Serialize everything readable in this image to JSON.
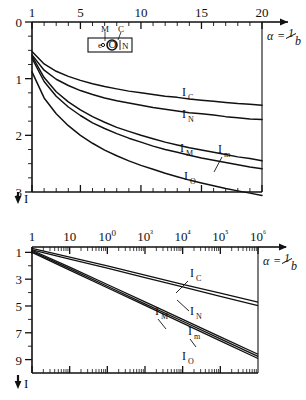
{
  "figure": {
    "panels": [
      {
        "name": "upper-panel",
        "axis_label_x": "α = 1/b",
        "axis_label_y": "I"
      },
      {
        "name": "lower-panel",
        "axis_label_x": "α = 1/b",
        "axis_label_y": "I"
      }
    ],
    "legend": {
      "name": "schematic-inset",
      "labels": {
        "m": "M",
        "c": "C",
        "n": "N",
        "e": "e",
        "o": "O"
      }
    },
    "alpha_symbol": "α",
    "equals": "=",
    "one": "1",
    "b": "b",
    "arrow_label": "I"
  },
  "chart_data": [
    {
      "type": "line",
      "name": "upper-panel",
      "title": "",
      "xlabel": "α = 1/b",
      "ylabel": "I",
      "xscale": "linear",
      "yscale": "linear",
      "xlim": [
        1,
        20
      ],
      "ylim": [
        0,
        3
      ],
      "y_inverted": true,
      "grid": false,
      "xticks": [
        1,
        5,
        10,
        15,
        20
      ],
      "xticklabels": [
        "1",
        "5",
        "10",
        "15",
        "20"
      ],
      "xminor_step": 1,
      "yticks": [
        0,
        1,
        2,
        3
      ],
      "yticklabels": [
        "0",
        "1",
        "2",
        "3"
      ],
      "yminor_step": 0.25,
      "legend_position": "inline-labels",
      "series": [
        {
          "name": "I_C",
          "label": "I",
          "sublabel": "C",
          "x": [
            1,
            2,
            3,
            4,
            5,
            6,
            7,
            8,
            9,
            10,
            11,
            12,
            13,
            14,
            15,
            16,
            17,
            18,
            19,
            20
          ],
          "y": [
            0.52,
            0.74,
            0.87,
            0.96,
            1.03,
            1.09,
            1.14,
            1.18,
            1.22,
            1.25,
            1.28,
            1.31,
            1.33,
            1.36,
            1.38,
            1.4,
            1.42,
            1.44,
            1.45,
            1.47
          ]
        },
        {
          "name": "I_N",
          "label": "I",
          "sublabel": "N",
          "x": [
            1,
            2,
            3,
            4,
            5,
            6,
            7,
            8,
            9,
            10,
            11,
            12,
            13,
            14,
            15,
            16,
            17,
            18,
            19,
            20
          ],
          "y": [
            0.58,
            0.85,
            1.01,
            1.12,
            1.21,
            1.28,
            1.34,
            1.39,
            1.43,
            1.47,
            1.51,
            1.54,
            1.57,
            1.6,
            1.62,
            1.64,
            1.67,
            1.69,
            1.71,
            1.72
          ]
        },
        {
          "name": "I_M",
          "label": "I",
          "sublabel": "M",
          "x": [
            1,
            2,
            3,
            4,
            5,
            6,
            7,
            8,
            9,
            10,
            11,
            12,
            13,
            14,
            15,
            16,
            17,
            18,
            19,
            20
          ],
          "y": [
            0.6,
            0.98,
            1.23,
            1.41,
            1.55,
            1.67,
            1.77,
            1.86,
            1.93,
            2.0,
            2.06,
            2.12,
            2.17,
            2.22,
            2.26,
            2.3,
            2.34,
            2.38,
            2.41,
            2.45
          ]
        },
        {
          "name": "I_m",
          "label": "I",
          "sublabel": "m",
          "x": [
            1,
            2,
            3,
            4,
            5,
            6,
            7,
            8,
            9,
            10,
            11,
            12,
            13,
            14,
            15,
            16,
            17,
            18,
            19,
            20
          ],
          "y": [
            0.64,
            1.05,
            1.31,
            1.5,
            1.65,
            1.78,
            1.88,
            1.97,
            2.05,
            2.12,
            2.19,
            2.25,
            2.3,
            2.35,
            2.4,
            2.44,
            2.48,
            2.52,
            2.56,
            2.59
          ]
        },
        {
          "name": "I_O",
          "label": "I",
          "sublabel": "O",
          "x": [
            1,
            2,
            3,
            4,
            5,
            6,
            7,
            8,
            9,
            10,
            11,
            12,
            13,
            14,
            15,
            16,
            17,
            18,
            19,
            20
          ],
          "y": [
            0.88,
            1.34,
            1.62,
            1.83,
            2.0,
            2.14,
            2.26,
            2.36,
            2.45,
            2.53,
            2.6,
            2.67,
            2.73,
            2.79,
            2.84,
            2.89,
            2.94,
            2.98,
            3.02,
            3.06
          ]
        }
      ]
    },
    {
      "type": "line",
      "name": "lower-panel",
      "title": "",
      "xlabel": "α = 1/b",
      "ylabel": "I",
      "xscale": "log",
      "yscale": "linear",
      "xlim": [
        1,
        1000000
      ],
      "ylim": [
        0.6,
        10
      ],
      "y_inverted": true,
      "grid": false,
      "xticks": [
        1,
        10,
        100,
        1000,
        10000,
        100000,
        1000000
      ],
      "xticklabels": [
        "1",
        "10",
        "100",
        "10³",
        "10⁴",
        "10⁵",
        "10⁶"
      ],
      "yticks": [
        1,
        3,
        5,
        7,
        9
      ],
      "yticklabels": [
        "1",
        "3",
        "5",
        "7",
        "9"
      ],
      "yminor_step": 1,
      "legend_position": "inline-labels",
      "series": [
        {
          "name": "I_C",
          "label": "I",
          "sublabel": "C",
          "x": [
            1,
            10,
            100,
            1000,
            10000,
            100000,
            1000000
          ],
          "y": [
            0.7,
            1.35,
            2.0,
            2.7,
            3.38,
            4.05,
            4.72
          ]
        },
        {
          "name": "I_N",
          "label": "I",
          "sublabel": "N",
          "x": [
            1,
            10,
            100,
            1000,
            10000,
            100000,
            1000000
          ],
          "y": [
            0.82,
            1.5,
            2.18,
            2.88,
            3.58,
            4.28,
            4.98
          ]
        },
        {
          "name": "I_M",
          "label": "I",
          "sublabel": "M",
          "x": [
            1,
            10,
            100,
            1000,
            10000,
            100000,
            1000000
          ],
          "y": [
            0.84,
            2.1,
            3.4,
            4.7,
            6.0,
            7.3,
            8.6
          ]
        },
        {
          "name": "I_m",
          "label": "I",
          "sublabel": "m",
          "x": [
            1,
            10,
            100,
            1000,
            10000,
            100000,
            1000000
          ],
          "y": [
            0.92,
            2.22,
            3.53,
            4.84,
            6.14,
            7.45,
            8.76
          ]
        },
        {
          "name": "I_O",
          "label": "I",
          "sublabel": "O",
          "x": [
            1,
            10,
            100,
            1000,
            10000,
            100000,
            1000000
          ],
          "y": [
            1.0,
            2.32,
            3.64,
            4.96,
            6.28,
            7.6,
            8.92
          ]
        }
      ]
    }
  ]
}
